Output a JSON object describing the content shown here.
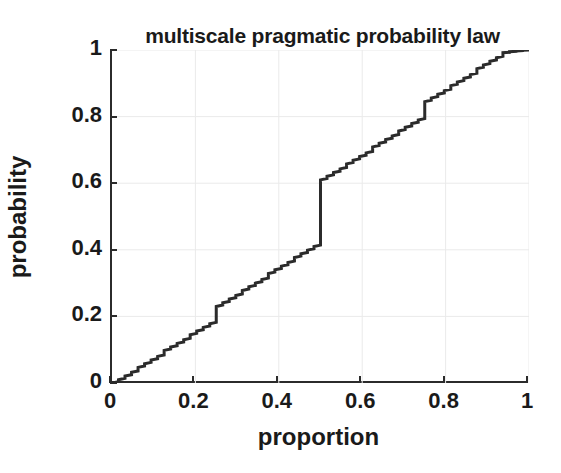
{
  "chart_data": {
    "type": "line",
    "title": "multiscale pragmatic probability law",
    "xlabel": "proportion",
    "ylabel": "probability",
    "xlim": [
      0,
      1
    ],
    "ylim": [
      0,
      1
    ],
    "grid": true,
    "legend": null,
    "line_color": "#2b2b2b",
    "line_width": 3,
    "background": "#ffffff",
    "axis_color": "#2b2b2b",
    "grid_color": "#eaeaea",
    "xticks": [
      0,
      0.2,
      0.4,
      0.6,
      0.8,
      1
    ],
    "xticklabels": [
      "0",
      "0.2",
      "0.4",
      "0.6",
      "0.8",
      "1"
    ],
    "yticks": [
      0,
      0.2,
      0.4,
      0.6,
      0.8,
      1
    ],
    "yticklabels": [
      "0",
      "0.2",
      "0.4",
      "0.6",
      "0.8",
      "1"
    ],
    "major_jumps": [
      {
        "x": 0.25,
        "y_from": 0.14,
        "y_to": 0.23
      },
      {
        "x": 0.5,
        "y_from": 0.38,
        "y_to": 0.61
      },
      {
        "x": 0.75,
        "y_from": 0.755,
        "y_to": 0.845
      }
    ],
    "x": [
      0.0,
      0.0156,
      0.0156,
      0.0312,
      0.0312,
      0.0469,
      0.0469,
      0.0625,
      0.0625,
      0.0781,
      0.0781,
      0.0938,
      0.0938,
      0.1094,
      0.1094,
      0.125,
      0.125,
      0.1406,
      0.1406,
      0.1562,
      0.1562,
      0.1719,
      0.1719,
      0.1875,
      0.1875,
      0.2031,
      0.2031,
      0.2188,
      0.2188,
      0.2344,
      0.2344,
      0.25,
      0.25,
      0.2656,
      0.2656,
      0.2812,
      0.2812,
      0.2969,
      0.2969,
      0.3125,
      0.3125,
      0.3281,
      0.3281,
      0.3438,
      0.3438,
      0.3594,
      0.3594,
      0.375,
      0.375,
      0.3906,
      0.3906,
      0.4062,
      0.4062,
      0.4219,
      0.4219,
      0.4375,
      0.4375,
      0.4531,
      0.4531,
      0.4688,
      0.4688,
      0.4844,
      0.4844,
      0.5,
      0.5,
      0.5156,
      0.5156,
      0.5312,
      0.5312,
      0.5469,
      0.5469,
      0.5625,
      0.5625,
      0.5781,
      0.5781,
      0.5938,
      0.5938,
      0.6094,
      0.6094,
      0.625,
      0.625,
      0.6406,
      0.6406,
      0.6562,
      0.6562,
      0.6719,
      0.6719,
      0.6875,
      0.6875,
      0.7031,
      0.7031,
      0.7188,
      0.7188,
      0.7344,
      0.7344,
      0.75,
      0.75,
      0.7656,
      0.7656,
      0.7812,
      0.7812,
      0.7969,
      0.7969,
      0.8125,
      0.8125,
      0.8281,
      0.8281,
      0.8438,
      0.8438,
      0.8594,
      0.8594,
      0.875,
      0.875,
      0.8906,
      0.8906,
      0.9062,
      0.9062,
      0.9219,
      0.9219,
      0.9375,
      0.9375,
      0.9531,
      0.9531,
      0.9688,
      0.9688,
      0.9844,
      0.9844,
      1.0
    ],
    "y": [
      0.0,
      0.004,
      0.01,
      0.014,
      0.021,
      0.025,
      0.032,
      0.036,
      0.047,
      0.051,
      0.058,
      0.062,
      0.069,
      0.073,
      0.08,
      0.084,
      0.098,
      0.102,
      0.108,
      0.112,
      0.119,
      0.123,
      0.13,
      0.134,
      0.145,
      0.149,
      0.156,
      0.16,
      0.167,
      0.171,
      0.178,
      0.182,
      0.23,
      0.234,
      0.241,
      0.245,
      0.252,
      0.256,
      0.263,
      0.267,
      0.278,
      0.282,
      0.289,
      0.293,
      0.3,
      0.304,
      0.311,
      0.315,
      0.329,
      0.333,
      0.34,
      0.344,
      0.351,
      0.355,
      0.362,
      0.366,
      0.377,
      0.381,
      0.388,
      0.392,
      0.399,
      0.403,
      0.41,
      0.414,
      0.61,
      0.614,
      0.621,
      0.625,
      0.632,
      0.636,
      0.643,
      0.647,
      0.658,
      0.662,
      0.669,
      0.673,
      0.68,
      0.684,
      0.691,
      0.695,
      0.709,
      0.713,
      0.72,
      0.724,
      0.731,
      0.735,
      0.742,
      0.746,
      0.757,
      0.761,
      0.768,
      0.772,
      0.779,
      0.783,
      0.79,
      0.794,
      0.845,
      0.849,
      0.856,
      0.86,
      0.867,
      0.871,
      0.878,
      0.882,
      0.893,
      0.897,
      0.904,
      0.908,
      0.915,
      0.919,
      0.926,
      0.93,
      0.944,
      0.948,
      0.955,
      0.959,
      0.966,
      0.97,
      0.977,
      0.981,
      0.992,
      0.993,
      0.995,
      0.996,
      0.997,
      0.998,
      0.999,
      1.0
    ]
  }
}
